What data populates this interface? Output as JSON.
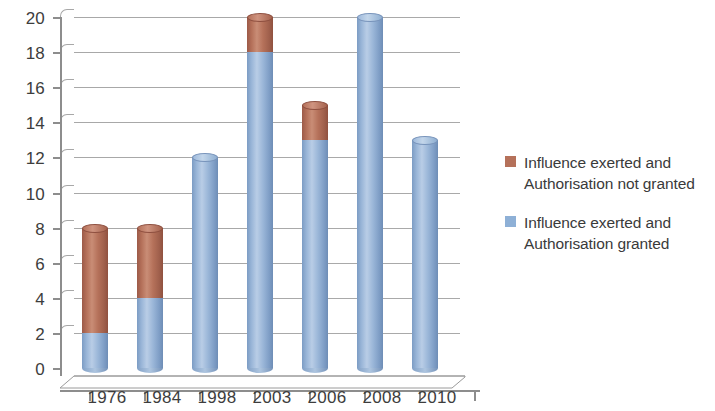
{
  "chart_data": {
    "type": "bar",
    "subtype": "stacked-cylinder-3d",
    "title": "",
    "xlabel": "",
    "ylabel": "",
    "categories": [
      "1976",
      "1984",
      "1998",
      "2003",
      "2006",
      "2008",
      "2010"
    ],
    "series": [
      {
        "name": "Influence exerted and Authorisation granted",
        "color": "#8eb0d6",
        "values": [
          2,
          4,
          12,
          18,
          13,
          20,
          13
        ]
      },
      {
        "name": "Influence exerted and Authorisation not granted",
        "color": "#b5715a",
        "values": [
          6,
          4,
          0,
          2,
          2,
          0,
          0
        ]
      }
    ],
    "totals": [
      8,
      8,
      12,
      20,
      15,
      20,
      13
    ],
    "ylim": [
      0,
      20
    ],
    "ytick_step": 2,
    "yticks": [
      0,
      2,
      4,
      6,
      8,
      10,
      12,
      14,
      16,
      18,
      20
    ],
    "ytick_labels": [
      "0",
      "2",
      "4",
      "6",
      "8",
      "10",
      "12",
      "14",
      "16",
      "18",
      "20"
    ],
    "grid": true,
    "grid_axis": "y",
    "legend_position": "right",
    "stack_order": [
      "Influence exerted and Authorisation granted",
      "Influence exerted and Authorisation not granted"
    ]
  },
  "axes": {
    "y_tick_labels": [
      "0",
      "2",
      "4",
      "6",
      "8",
      "10",
      "12",
      "14",
      "16",
      "18",
      "20"
    ],
    "x_tick_labels": [
      "1976",
      "1984",
      "1998",
      "2003",
      "2006",
      "2008",
      "2010"
    ]
  },
  "legend": {
    "items": [
      {
        "label": "Influence exerted and\nAuthorisation not granted",
        "color": "#b5715a",
        "swatch_name": "legend-swatch-not-granted"
      },
      {
        "label": "Influence exerted and\nAuthorisation granted",
        "color": "#8eb0d6",
        "swatch_name": "legend-swatch-granted"
      }
    ]
  },
  "colors": {
    "series_granted": "#8eb0d6",
    "series_not_granted": "#b5715a",
    "gridline": "#9a9a9a",
    "axis": "#8d8d8d",
    "text": "#3a3a3a",
    "background": "#ffffff"
  }
}
